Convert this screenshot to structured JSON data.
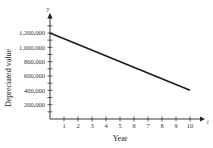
{
  "chart_data": {
    "type": "line",
    "title": "",
    "xlabel": "Year",
    "ylabel": "Depreciated value",
    "x_axis_variable": "t",
    "y_axis_variable": "y",
    "xlim": [
      0,
      10
    ],
    "ylim": [
      0,
      1300000
    ],
    "x_ticks": [
      1,
      2,
      3,
      4,
      5,
      6,
      7,
      8,
      9,
      10
    ],
    "y_ticks": [
      200000,
      400000,
      600000,
      800000,
      1000000,
      1200000
    ],
    "x_tick_labels": [
      "1",
      "2",
      "3",
      "4",
      "5",
      "6",
      "7",
      "8",
      "9",
      "10"
    ],
    "y_tick_labels": [
      "200,000",
      "400,000",
      "600,000",
      "800,000",
      "1,000,000",
      "1,200,000"
    ],
    "grid": false,
    "legend": null,
    "series": [
      {
        "name": "Depreciated value",
        "x": [
          0,
          10
        ],
        "values": [
          1200000,
          400000
        ],
        "color": "#1a1a1a"
      }
    ]
  }
}
